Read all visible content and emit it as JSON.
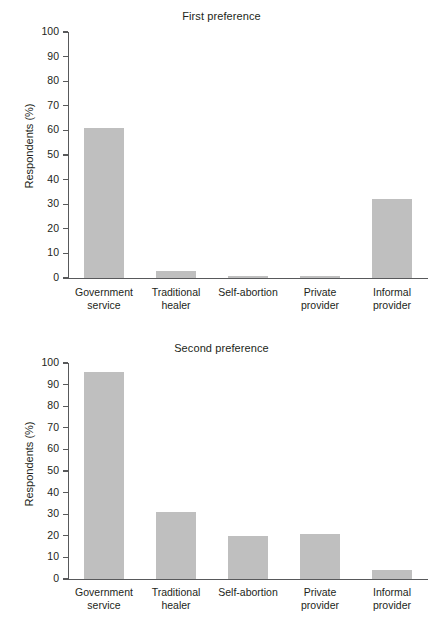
{
  "chart_data": [
    {
      "type": "bar",
      "title": "First preference",
      "xlabel": "",
      "ylabel": "Respondents (%)",
      "ylim": [
        0,
        100
      ],
      "ytick_step": 10,
      "yticks": [
        0,
        10,
        20,
        30,
        40,
        50,
        60,
        70,
        80,
        90,
        100
      ],
      "grid": false,
      "legend": "none",
      "bar_color": "#bfbfbf",
      "categories": [
        "Government\nservice",
        "Traditional\nhealer",
        "Self-abortion",
        "Private\nprovider",
        "Informal\nprovider"
      ],
      "values": [
        61,
        3,
        1,
        1,
        32
      ]
    },
    {
      "type": "bar",
      "title": "Second preference",
      "xlabel": "",
      "ylabel": "Respondents (%)",
      "ylim": [
        0,
        100
      ],
      "ytick_step": 10,
      "yticks": [
        0,
        10,
        20,
        30,
        40,
        50,
        60,
        70,
        80,
        90,
        100
      ],
      "grid": false,
      "legend": "none",
      "bar_color": "#bfbfbf",
      "categories": [
        "Government\nservice",
        "Traditional\nhealer",
        "Self-abortion",
        "Private\nprovider",
        "Informal\nprovider"
      ],
      "values": [
        96,
        31,
        20,
        21,
        4
      ]
    }
  ],
  "charts": {
    "first": {
      "title": "First preference",
      "ylabel": "Respondents (%)",
      "yticks": [
        "100",
        "90",
        "80",
        "70",
        "60",
        "50",
        "40",
        "30",
        "20",
        "10",
        "0"
      ],
      "categories": [
        "Government\nservice",
        "Traditional\nhealer",
        "Self-abortion",
        "Private\nprovider",
        "Informal\nprovider"
      ]
    },
    "second": {
      "title": "Second preference",
      "ylabel": "Respondents (%)",
      "yticks": [
        "100",
        "90",
        "80",
        "70",
        "60",
        "50",
        "40",
        "30",
        "20",
        "10",
        "0"
      ],
      "categories": [
        "Government\nservice",
        "Traditional\nhealer",
        "Self-abortion",
        "Private\nprovider",
        "Informal\nprovider"
      ]
    }
  }
}
